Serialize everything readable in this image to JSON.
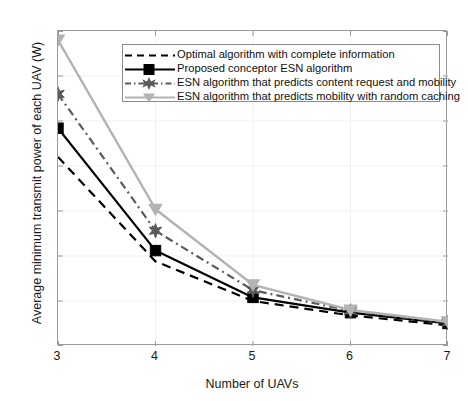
{
  "chart_data": {
    "type": "line",
    "title": "",
    "xlabel": "Number of UAVs",
    "ylabel": "Average minimum transmit power of each UAV (W)",
    "x": [
      3,
      4,
      5,
      6,
      7
    ],
    "xticklabels": [
      "3",
      "4",
      "5",
      "6",
      "7"
    ],
    "yticklabels": [
      "0",
      "5",
      "10",
      "15",
      "20",
      "25",
      "30",
      "35"
    ],
    "xlim": [
      3,
      7
    ],
    "ylim": [
      0,
      35
    ],
    "grid": true,
    "legend_position": "top-right-inside",
    "series": [
      {
        "name": "Optimal algorithm with complete information",
        "values": [
          21.0,
          9.4,
          5.0,
          3.4,
          2.3
        ],
        "color": "#000000",
        "style": "dashed",
        "marker": "none"
      },
      {
        "name": "Proposed conceptor ESN algorithm",
        "values": [
          24.2,
          10.6,
          5.4,
          3.7,
          2.5
        ],
        "color": "#000000",
        "style": "solid",
        "marker": "square"
      },
      {
        "name": "ESN algorithm that predicts content request and mobility",
        "values": [
          28.0,
          12.8,
          6.2,
          3.9,
          2.6
        ],
        "color": "#5a5a5a",
        "style": "dashdot",
        "marker": "star"
      },
      {
        "name": "ESN algorithm that predicts mobility with random caching",
        "values": [
          34.0,
          15.2,
          6.8,
          4.0,
          2.7
        ],
        "color": "#b3b3b3",
        "style": "solid",
        "marker": "triangle-down"
      }
    ]
  },
  "legend": {
    "items": [
      "Optimal algorithm with complete information",
      "Proposed conceptor ESN algorithm",
      "ESN algorithm that predicts content request and mobility",
      "ESN algorithm that predicts mobility with random caching"
    ]
  },
  "axes": {
    "x_title": "Number of UAVs",
    "y_title": "Average minimum transmit power of each UAV (W)",
    "xticks": [
      "3",
      "4",
      "5",
      "6",
      "7"
    ],
    "yticks": [
      "0",
      "5",
      "10",
      "15",
      "20",
      "25",
      "30",
      "35"
    ]
  },
  "colors": {
    "axis": "#9a9a9a",
    "grid": "#f0f0f0",
    "text": "#1a1a1a",
    "series1": "#000000",
    "series2": "#000000",
    "series3": "#5a5a5a",
    "series4": "#b3b3b3"
  }
}
